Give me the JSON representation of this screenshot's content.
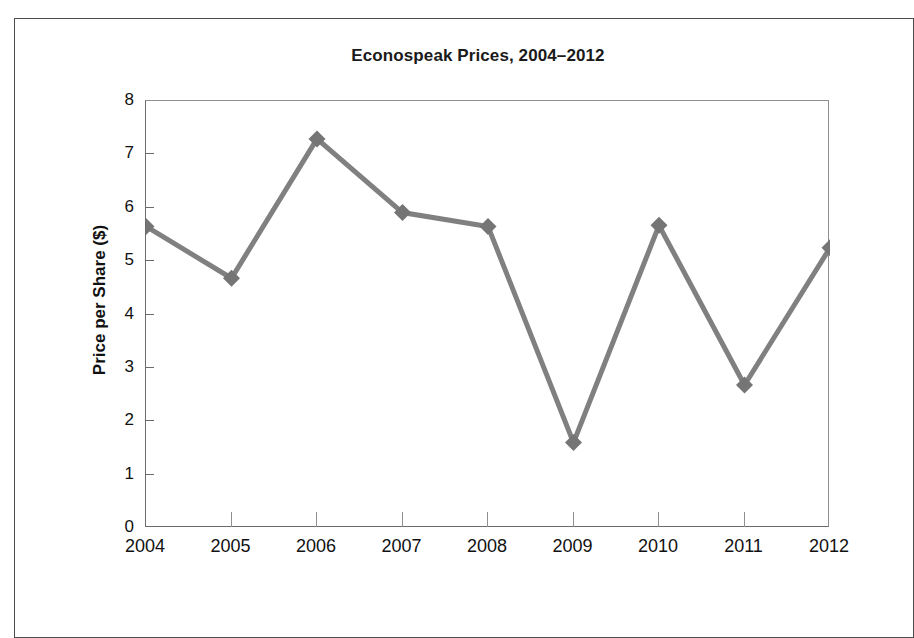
{
  "chart_data": {
    "type": "line",
    "title": "Econospeak Prices, 2004–2012",
    "xlabel": "",
    "ylabel": "Price per Share ($)",
    "categories": [
      "2004",
      "2005",
      "2006",
      "2007",
      "2008",
      "2009",
      "2010",
      "2011",
      "2012"
    ],
    "values": [
      5.65,
      4.68,
      7.29,
      5.91,
      5.65,
      1.6,
      5.67,
      2.68,
      5.25
    ],
    "x": [
      2004,
      2005,
      2006,
      2007,
      2008,
      2009,
      2010,
      2011,
      2012
    ],
    "ylim": [
      0,
      8
    ],
    "y_ticks": [
      "0",
      "1",
      "2",
      "3",
      "4",
      "5",
      "6",
      "7",
      "8"
    ],
    "xlim": [
      2004,
      2012
    ],
    "grid": false,
    "legend": null,
    "series": [
      {
        "name": "Price per Share ($)",
        "values": [
          5.65,
          4.68,
          7.29,
          5.91,
          5.65,
          1.6,
          5.67,
          2.68,
          5.25
        ],
        "color": "#808080",
        "marker": "diamond",
        "line_width": 5
      }
    ],
    "colors": {
      "line": "#808080",
      "marker": "#757575",
      "axis": "#6b6b6b",
      "text": "#111111",
      "frame": "#4d4d4d",
      "background": "#ffffff"
    }
  }
}
